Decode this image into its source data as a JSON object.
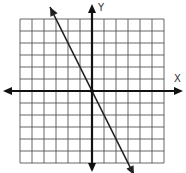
{
  "chart_data": {
    "type": "line",
    "title": "",
    "xlabel": "X",
    "ylabel": "Y",
    "xlim": [
      -6,
      6
    ],
    "ylim": [
      -6,
      6
    ],
    "grid": true,
    "grid_step": 1,
    "axes_arrows": true,
    "series": [
      {
        "name": "y = -2x",
        "equation": "y = -2x",
        "slope": -2,
        "intercept": 0,
        "x": [
          -3.5,
          3.5
        ],
        "y": [
          7,
          -7
        ],
        "arrows_both_ends": true
      }
    ],
    "colors": {
      "grid": "#555555",
      "axis": "#111111",
      "line": "#222222"
    }
  }
}
